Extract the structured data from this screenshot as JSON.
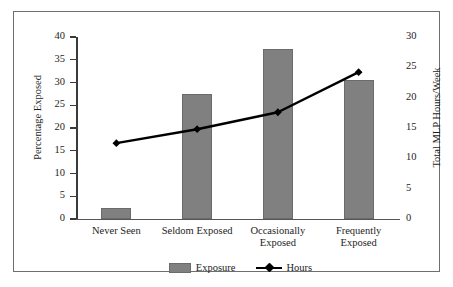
{
  "chart_data": {
    "type": "bar",
    "title": "",
    "subtitle": "",
    "categories": [
      "Never Seen",
      "Seldom Exposed",
      "Occasionally\nExposed",
      "Frequently\nExposed"
    ],
    "series": [
      {
        "name": "Exposure",
        "type": "bar",
        "axis": "left",
        "values": [
          2.4,
          27.4,
          37.4,
          30.6
        ],
        "color": "#808080"
      },
      {
        "name": "Hours",
        "type": "line",
        "axis": "right",
        "values": [
          12.5,
          14.8,
          17.6,
          24.2
        ],
        "color": "#000000",
        "marker": "diamond"
      }
    ],
    "xlabel": "",
    "ylabel": "Percentage Exposed",
    "y2label": "Total MLP Hours/Week",
    "ylim": [
      0,
      40
    ],
    "y2lim": [
      0,
      30
    ],
    "yticks": [
      0,
      5,
      10,
      15,
      20,
      25,
      30,
      35,
      40
    ],
    "y2ticks": [
      0,
      5,
      10,
      15,
      20,
      25,
      30
    ],
    "ytick_labels": [
      "0",
      "5",
      "10",
      "15",
      "20",
      "25",
      "30",
      "35",
      "40"
    ],
    "y2tick_labels": [
      "0",
      "5",
      "10",
      "15",
      "20",
      "25",
      "30"
    ],
    "grid": false,
    "legend_position": "bottom"
  },
  "axes": {
    "left_title": "Percentage Exposed",
    "right_title": "Total MLP Hours/Week"
  },
  "legend": {
    "items": [
      {
        "label": "Exposure",
        "marker": "gray-swatch"
      },
      {
        "label": "Hours",
        "marker": "black-line-diamond"
      }
    ]
  },
  "colors": {
    "bar_fill": "#808080",
    "bar_stroke": "#6b6b6b",
    "line": "#000000",
    "axis": "#3a3a3a",
    "border": "#6e6e72",
    "background": "#ffffff",
    "text": "#1d1d1d"
  }
}
